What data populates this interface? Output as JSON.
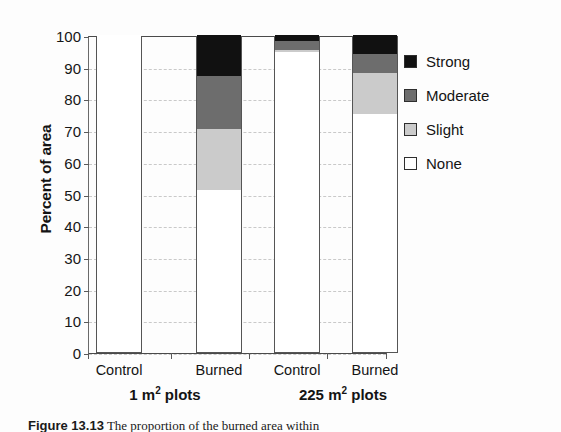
{
  "chart_data": {
    "type": "bar",
    "subtype": "stacked-bar",
    "title": "",
    "xlabel": "",
    "ylabel": "Percent of area",
    "ylim": [
      0,
      100
    ],
    "ytick_step": 10,
    "yticks": [
      100,
      90,
      80,
      70,
      60,
      50,
      40,
      30,
      20,
      10,
      0
    ],
    "grid": "horizontal-dashed",
    "legend_position": "right",
    "categories": [
      "Control",
      "Burned",
      "Control",
      "Burned"
    ],
    "groups": [
      {
        "label": "1 m2 plots",
        "label_base": "1 m",
        "label_sup": "2",
        "label_tail": " plots",
        "categories": [
          "Control",
          "Burned"
        ]
      },
      {
        "label": "225 m2 plots",
        "label_base": "225 m",
        "label_sup": "2",
        "label_tail": " plots",
        "categories": [
          "Control",
          "Burned"
        ]
      }
    ],
    "series": [
      {
        "name": "None",
        "color": "#ffffff",
        "values": [
          100,
          51,
          94.5,
          75
        ]
      },
      {
        "name": "Slight",
        "color": "#cbcbcb",
        "values": [
          0,
          19.5,
          0.8,
          13
        ]
      },
      {
        "name": "Moderate",
        "color": "#6d6d6d",
        "values": [
          0,
          16.5,
          2.7,
          6
        ]
      },
      {
        "name": "Strong",
        "color": "#111111",
        "values": [
          0,
          13,
          2,
          6
        ]
      }
    ],
    "bars": [
      {
        "category": "Control",
        "group": "1 m2 plots",
        "none": 100,
        "slight": 0,
        "moderate": 0,
        "strong": 0
      },
      {
        "category": "Burned",
        "group": "1 m2 plots",
        "none": 51,
        "slight": 19.5,
        "moderate": 16.5,
        "strong": 13
      },
      {
        "category": "Control",
        "group": "225 m2 plots",
        "none": 94.5,
        "slight": 0.8,
        "moderate": 2.7,
        "strong": 2
      },
      {
        "category": "Burned",
        "group": "225 m2 plots",
        "none": 75,
        "slight": 13,
        "moderate": 6,
        "strong": 6
      }
    ],
    "legend": [
      {
        "label": "Strong",
        "color": "#111111"
      },
      {
        "label": "Moderate",
        "color": "#6d6d6d"
      },
      {
        "label": "Slight",
        "color": "#cbcbcb"
      },
      {
        "label": "None",
        "color": "#ffffff"
      }
    ]
  },
  "axis": {
    "y_title": "Percent of area",
    "y_ticks": [
      "100",
      "90",
      "80",
      "70",
      "60",
      "50",
      "40",
      "30",
      "20",
      "10",
      "0"
    ]
  },
  "x_labels": [
    "Control",
    "Burned",
    "Control",
    "Burned"
  ],
  "group_labels": [
    {
      "base": "1 m",
      "sup": "2",
      "tail": " plots"
    },
    {
      "base": "225 m",
      "sup": "2",
      "tail": " plots"
    }
  ],
  "legend": {
    "items": [
      {
        "label": "Strong"
      },
      {
        "label": "Moderate"
      },
      {
        "label": "Slight"
      },
      {
        "label": "None"
      }
    ]
  },
  "caption": {
    "figure_number": "Figure 13.13",
    "text": "The proportion of the burned area within"
  }
}
